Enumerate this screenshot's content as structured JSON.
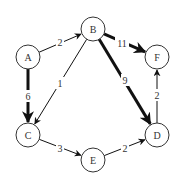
{
  "diagram": {
    "type": "weighted-directed-graph",
    "nodes": [
      {
        "id": "A",
        "label": "A"
      },
      {
        "id": "B",
        "label": "B"
      },
      {
        "id": "C",
        "label": "C"
      },
      {
        "id": "D",
        "label": "D"
      },
      {
        "id": "E",
        "label": "E"
      },
      {
        "id": "F",
        "label": "F"
      }
    ],
    "edges": [
      {
        "from": "A",
        "to": "B",
        "weight": "2",
        "emphasis": "normal"
      },
      {
        "from": "A",
        "to": "C",
        "weight": "6",
        "emphasis": "bold"
      },
      {
        "from": "B",
        "to": "C",
        "weight": "1",
        "emphasis": "normal"
      },
      {
        "from": "B",
        "to": "F",
        "weight": "11",
        "emphasis": "bold"
      },
      {
        "from": "B",
        "to": "D",
        "weight": "9",
        "emphasis": "bold"
      },
      {
        "from": "C",
        "to": "E",
        "weight": "3",
        "emphasis": "normal"
      },
      {
        "from": "E",
        "to": "D",
        "weight": "2",
        "emphasis": "normal"
      },
      {
        "from": "D",
        "to": "F",
        "weight": "2",
        "emphasis": "normal"
      }
    ]
  }
}
